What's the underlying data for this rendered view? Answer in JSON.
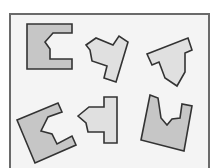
{
  "diagram": {
    "type": "shape-puzzle",
    "frame": {
      "x": 9,
      "y": 13,
      "width": 201,
      "height": 160,
      "border_color": "#6a6a6a",
      "background": "#f4f4f4"
    },
    "colors": {
      "dark_fill": "#c6c6c6",
      "light_fill": "#e0e0e0",
      "stroke": "#333333"
    },
    "shapes": [
      {
        "id": "shape-1",
        "row": 1,
        "col": 1,
        "fill": "dark",
        "points": "27,24 72,24 72,33 53,33 45,42 50,49 50,59 72,59 72,69 27,69"
      },
      {
        "id": "shape-2",
        "row": 1,
        "col": 2,
        "fill": "light",
        "points": "86,45 96,38 113,45 119,36 128,42 116,82 104,78 107,66 92,61 90,50"
      },
      {
        "id": "shape-3",
        "row": 1,
        "col": 3,
        "fill": "light",
        "points": "147,54 188,38 192,50 185,53 185,72 177,86 165,78 159,62 152,65"
      },
      {
        "id": "shape-4",
        "row": 2,
        "col": 1,
        "fill": "dark",
        "points": "17,120 58,103 62,112 48,117 41,131 52,134 57,144 72,136 76,145 35,163"
      },
      {
        "id": "shape-5",
        "row": 2,
        "col": 2,
        "fill": "light",
        "points": "78,116 89,107 104,107 104,97 117,97 117,143 104,143 104,132 88,132 86,123"
      },
      {
        "id": "shape-6",
        "row": 2,
        "col": 3,
        "fill": "dark",
        "points": "150,95 158,98 161,118 167,125 172,119 180,118 182,104 192,106 184,151 141,140"
      }
    ]
  }
}
